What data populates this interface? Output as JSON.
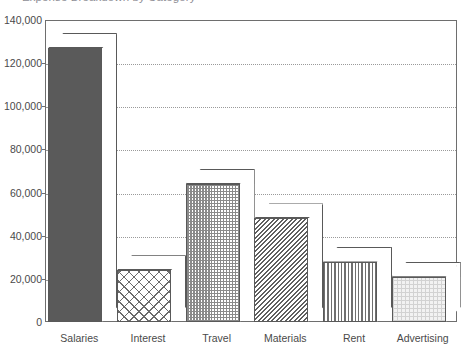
{
  "chart_data": {
    "type": "bar",
    "title": "Expense Breakdown by Category",
    "xlabel": "",
    "ylabel": "",
    "categories": [
      "Salaries",
      "Interest",
      "Travel",
      "Materials",
      "Rent",
      "Advertising"
    ],
    "values": [
      127000,
      24000,
      64000,
      48000,
      28000,
      21000
    ],
    "ylim": [
      0,
      140000
    ],
    "ytick_labels": [
      "140,000",
      "120,000",
      "100,000",
      "80,000",
      "60,000",
      "40,000",
      "20,000",
      "0"
    ],
    "ytick_values": [
      140000,
      120000,
      100000,
      80000,
      60000,
      40000,
      20000,
      0
    ],
    "grid": true,
    "gridline_style": "dotted",
    "legend": "none",
    "style": "3d-bar",
    "bar_patterns": [
      "solid-dark-gray",
      "cross-hatch",
      "checkerboard",
      "diagonal-hatch",
      "vertical-lines",
      "light-dots"
    ],
    "colors": {
      "axis": "#6e6e6e",
      "gridline": "#9a9a9a",
      "bar_outline": "#595959",
      "text": "#4a4a4a",
      "background": "#ffffff",
      "salaries_fill": "#5a5a5a"
    }
  }
}
